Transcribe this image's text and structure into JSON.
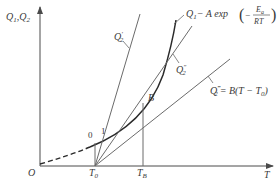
{
  "diagram": {
    "type": "thermal-ignition-diagram",
    "axes": {
      "y_label": "Q",
      "y_label_sub1": "1",
      "y_label_sep": ",Q",
      "y_label_sub2": "2",
      "x_label": "T",
      "origin_label": "O"
    },
    "x_ticks": {
      "t0": {
        "main": "T",
        "sub": "0"
      },
      "tb": {
        "main": "T",
        "sub": "B"
      }
    },
    "points": {
      "point_0": "0",
      "point_1": "1",
      "point_b": "B"
    },
    "curves": {
      "q1": {
        "name": "Q",
        "sub": "1",
        "formula_prefix": "− A exp",
        "formula_num": "E",
        "formula_num_sub": "a",
        "formula_den": "RT",
        "formula_minus": "−"
      },
      "q2_prime": {
        "name": "Q",
        "sub": "2",
        "sup": "′"
      },
      "q2_dprime": {
        "name": "Q",
        "sub": "2",
        "sup": "″"
      },
      "q2_tprime": {
        "name": "Q",
        "sub": "2",
        "sup": "‴",
        "formula": "= B(T − T",
        "formula_sub": "0",
        "formula_end": ")"
      }
    },
    "colors": {
      "line": "#6b6b6b",
      "curve": "#2a2a2a",
      "text": "#3a3a3a"
    }
  }
}
